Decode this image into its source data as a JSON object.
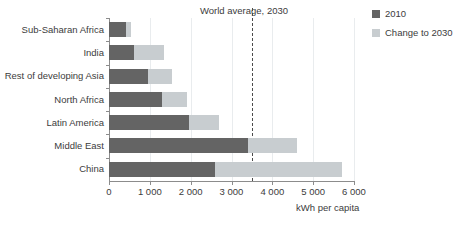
{
  "chart_data": {
    "type": "bar",
    "orientation": "horizontal",
    "stacked": true,
    "title": "",
    "xlabel": "kWh per capita",
    "ylabel": "",
    "xlim": [
      0,
      6000
    ],
    "xticks": [
      0,
      1000,
      2000,
      3000,
      4000,
      5000,
      6000
    ],
    "xtick_labels": [
      "0",
      "1 000",
      "2 000",
      "3 000",
      "4 000",
      "5 000",
      "6 000"
    ],
    "grid": true,
    "grid_axis": "x",
    "legend_position": "top-right",
    "categories": [
      "Sub-Saharan Africa",
      "India",
      "Rest of developing Asia",
      "North Africa",
      "Latin America",
      "Middle East",
      "China"
    ],
    "series": [
      {
        "name": "2010",
        "color": "#646464",
        "values": [
          420,
          620,
          950,
          1300,
          1950,
          3400,
          2600
        ]
      },
      {
        "name": "Change to 2030",
        "color": "#c8cdd0",
        "values": [
          110,
          730,
          600,
          600,
          750,
          1200,
          3100
        ]
      }
    ],
    "totals_2030": [
      530,
      1350,
      1550,
      1900,
      2700,
      4600,
      5700
    ],
    "annotations": [
      {
        "label": "World average, 2030",
        "type": "vertical-reference-line",
        "value": 3500,
        "style": "dashed",
        "color": "#4a4a4a"
      }
    ]
  },
  "legend": {
    "items": [
      {
        "label": "2010",
        "color": "#646464"
      },
      {
        "label": "Change to 2030",
        "color": "#c8cdd0"
      }
    ]
  }
}
